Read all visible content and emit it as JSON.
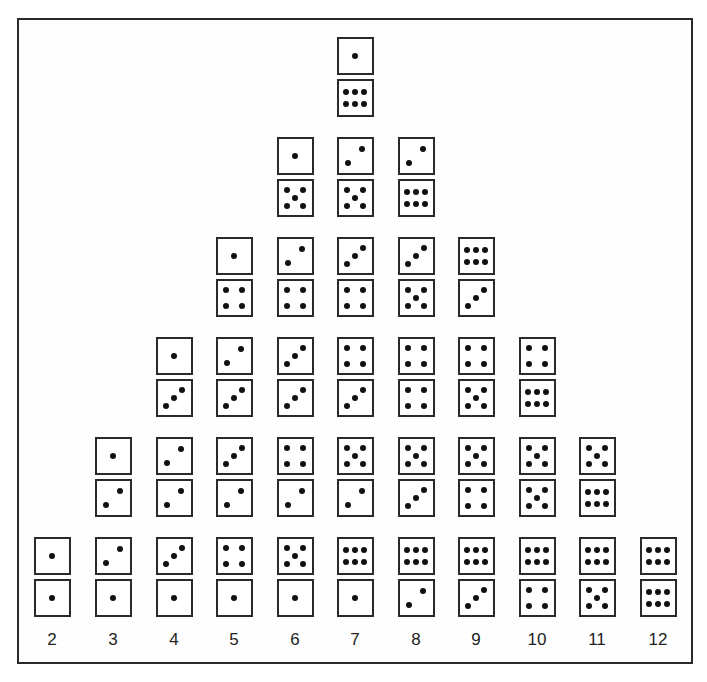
{
  "diagram": {
    "title": "",
    "x_labels": [
      "2",
      "3",
      "4",
      "5",
      "6",
      "7",
      "8",
      "9",
      "10",
      "11",
      "12"
    ],
    "columns": [
      {
        "sum": "2",
        "pairs": [
          [
            1,
            1
          ]
        ]
      },
      {
        "sum": "3",
        "pairs": [
          [
            2,
            1
          ],
          [
            1,
            2
          ]
        ]
      },
      {
        "sum": "4",
        "pairs": [
          [
            3,
            1
          ],
          [
            2,
            2
          ],
          [
            1,
            3
          ]
        ]
      },
      {
        "sum": "5",
        "pairs": [
          [
            4,
            1
          ],
          [
            3,
            2
          ],
          [
            2,
            3
          ],
          [
            1,
            4
          ]
        ]
      },
      {
        "sum": "6",
        "pairs": [
          [
            5,
            1
          ],
          [
            4,
            2
          ],
          [
            3,
            3
          ],
          [
            2,
            4
          ],
          [
            1,
            5
          ]
        ]
      },
      {
        "sum": "7",
        "pairs": [
          [
            6,
            1
          ],
          [
            5,
            2
          ],
          [
            4,
            3
          ],
          [
            3,
            4
          ],
          [
            2,
            5
          ],
          [
            1,
            6
          ]
        ]
      },
      {
        "sum": "8",
        "pairs": [
          [
            6,
            2
          ],
          [
            5,
            3
          ],
          [
            4,
            4
          ],
          [
            3,
            5
          ],
          [
            2,
            6
          ]
        ]
      },
      {
        "sum": "9",
        "pairs": [
          [
            6,
            3
          ],
          [
            5,
            4
          ],
          [
            4,
            5
          ],
          [
            6,
            3
          ]
        ]
      },
      {
        "sum": "10",
        "pairs": [
          [
            6,
            4
          ],
          [
            5,
            5
          ],
          [
            4,
            6
          ]
        ]
      },
      {
        "sum": "11",
        "pairs": [
          [
            6,
            5
          ],
          [
            5,
            6
          ]
        ]
      },
      {
        "sum": "12",
        "pairs": [
          [
            6,
            6
          ]
        ]
      }
    ]
  },
  "chart_data": {
    "type": "bar",
    "title": "",
    "xlabel": "",
    "ylabel": "",
    "categories": [
      "2",
      "3",
      "4",
      "5",
      "6",
      "7",
      "8",
      "9",
      "10",
      "11",
      "12"
    ],
    "values": [
      1,
      2,
      3,
      4,
      5,
      6,
      5,
      4,
      3,
      2,
      1
    ],
    "grid": false,
    "legend": null
  }
}
